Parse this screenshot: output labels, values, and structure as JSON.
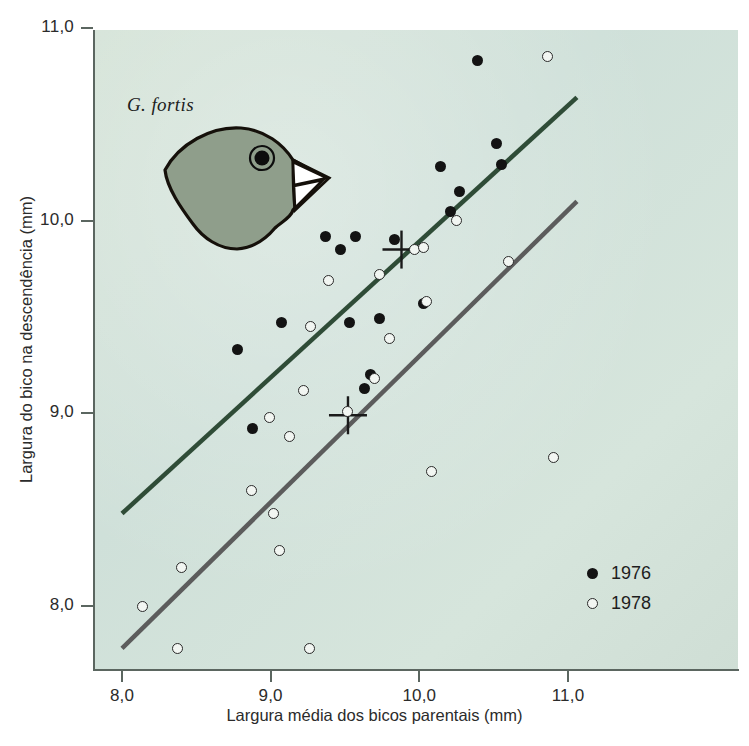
{
  "chart_data": {
    "type": "scatter",
    "title": "",
    "xlabel": "Largura média dos bicos parentais (mm)",
    "ylabel": "Largura do bico na descendência (mm)",
    "xlim": [
      7.8,
      11.2
    ],
    "ylim": [
      7.75,
      11.0
    ],
    "xticks": [
      8.0,
      9.0,
      10.0,
      11.0
    ],
    "yticks": [
      8.0,
      9.0,
      10.0,
      11.0
    ],
    "xtick_labels": [
      "8,0",
      "9,0",
      "10,0",
      "11,0"
    ],
    "ytick_labels": [
      "8,0",
      "9,0",
      "10,0",
      "11,0"
    ],
    "grid": false,
    "annotation_species": "G. fortis",
    "legend_position": "bottom-right",
    "series": [
      {
        "name": "1976",
        "marker": "filled-circle",
        "color": "#131313",
        "points": [
          [
            8.88,
            8.92
          ],
          [
            8.78,
            9.33
          ],
          [
            9.07,
            9.47
          ],
          [
            9.53,
            9.47
          ],
          [
            9.63,
            9.13
          ],
          [
            9.67,
            9.2
          ],
          [
            9.57,
            9.92
          ],
          [
            9.73,
            9.49
          ],
          [
            9.47,
            9.85
          ],
          [
            9.37,
            9.92
          ],
          [
            9.83,
            9.9
          ],
          [
            10.03,
            9.57
          ],
          [
            10.14,
            10.28
          ],
          [
            10.21,
            10.05
          ],
          [
            10.27,
            10.15
          ],
          [
            10.39,
            10.83
          ],
          [
            10.52,
            10.4
          ],
          [
            10.55,
            10.29
          ]
        ]
      },
      {
        "name": "1978",
        "marker": "open-circle",
        "color": "#f2f6f2",
        "points": [
          [
            8.14,
            8.0
          ],
          [
            8.37,
            7.78
          ],
          [
            8.4,
            8.2
          ],
          [
            8.87,
            8.6
          ],
          [
            9.02,
            8.48
          ],
          [
            9.06,
            8.29
          ],
          [
            9.26,
            7.78
          ],
          [
            8.99,
            8.98
          ],
          [
            9.13,
            8.88
          ],
          [
            9.22,
            9.12
          ],
          [
            9.27,
            9.45
          ],
          [
            9.39,
            9.69
          ],
          [
            9.52,
            9.01
          ],
          [
            9.7,
            9.18
          ],
          [
            9.73,
            9.72
          ],
          [
            9.8,
            9.39
          ],
          [
            9.97,
            9.85
          ],
          [
            10.03,
            9.86
          ],
          [
            10.05,
            9.58
          ],
          [
            10.08,
            8.7
          ],
          [
            10.25,
            10.0
          ],
          [
            10.6,
            9.79
          ],
          [
            10.86,
            10.85
          ],
          [
            10.9,
            8.77
          ]
        ]
      }
    ],
    "regression_lines": [
      {
        "name": "1976-line",
        "color": "#2f4c37",
        "x_start": 8.0,
        "y_start": 8.48,
        "x_end": 11.06,
        "y_end": 10.64
      },
      {
        "name": "1978-line",
        "color": "#5c5c5c",
        "x_start": 8.0,
        "y_start": 7.78,
        "x_end": 11.06,
        "y_end": 10.1
      }
    ],
    "mean_markers": [
      {
        "name": "1976-mean-cross",
        "x": 9.88,
        "y": 9.85
      },
      {
        "name": "1978-mean-cross",
        "x": 9.52,
        "y": 8.99
      }
    ]
  },
  "axes": {
    "x_title": "Largura média dos bicos parentais (mm)",
    "y_title": "Largura do bico na descendência (mm)",
    "x_labels": [
      "8,0",
      "9,0",
      "10,0",
      "11,0"
    ],
    "y_labels": [
      "11,0",
      "10,0",
      "9,0",
      "8,0"
    ]
  },
  "annotation": {
    "species_label": "G. fortis"
  },
  "legend": {
    "items": [
      {
        "label": "1976",
        "marker": "filled-circle"
      },
      {
        "label": "1978",
        "marker": "open-circle"
      }
    ]
  },
  "colors": {
    "plot_background": "#d3e2d6",
    "line_1976": "#2f4c37",
    "line_1978": "#5c5c5c",
    "point_filled": "#131313",
    "point_open_fill": "#f2f6f2",
    "axis": "#5b6660",
    "finch_body": "#8f9e8b",
    "text": "#2b2b2b"
  }
}
